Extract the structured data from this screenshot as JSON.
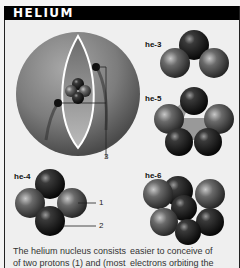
{
  "header": {
    "title": "HELIUM"
  },
  "diagram": {
    "atom_callout": "3",
    "nucleus_callouts": [
      "1",
      "2"
    ]
  },
  "isotopes": [
    {
      "id": "he-3",
      "label": "he-3",
      "spheres": 3
    },
    {
      "id": "he-4",
      "label": "he-4",
      "spheres": 4
    },
    {
      "id": "he-5",
      "label": "he-5",
      "spheres": 5
    },
    {
      "id": "he-6",
      "label": "he-6",
      "spheres": 6
    }
  ],
  "body_text": {
    "col1": [
      "The helium nucleus consists",
      "of two protons (1) and (most"
    ],
    "col2": [
      "easier to conceive of",
      "electrons orbiting the"
    ]
  },
  "colors": {
    "header_bg": "#000000",
    "header_text": "#ffffff",
    "page_bg": "#efefef",
    "sphere_dark": "#111111",
    "sphere_mid": "#555555"
  }
}
